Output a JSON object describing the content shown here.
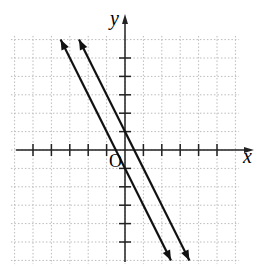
{
  "chart_data": {
    "type": "line",
    "title": "",
    "xlabel": "x",
    "ylabel": "y",
    "origin_label": "O",
    "xlim": [
      -6,
      6
    ],
    "ylim": [
      -6,
      6
    ],
    "grid": true,
    "series": [
      {
        "name": "y = -2x + 1",
        "slope": -2,
        "intercept": 1,
        "x": [
          -2.5,
          3.5
        ],
        "y": [
          6,
          -6
        ]
      },
      {
        "name": "y = -2x - 1",
        "slope": -2,
        "intercept": -1,
        "x": [
          -3.5,
          2.5
        ],
        "y": [
          6,
          -6
        ]
      }
    ]
  }
}
